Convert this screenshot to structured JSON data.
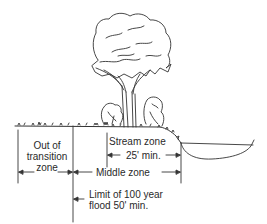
{
  "diagram": {
    "type": "riparian buffer zones cross-section",
    "labels": {
      "out_of_transition_1": "Out of",
      "out_of_transition_2": "transition",
      "out_of_transition_3": "zone",
      "stream_zone": "Stream zone",
      "stream_zone_min": "25' min.",
      "middle_zone": "Middle zone",
      "flood_limit_1": "Limit of 100 year",
      "flood_limit_2": "flood 50' min."
    },
    "elements": [
      "tree",
      "shrub-left",
      "shrub-right",
      "ground-line",
      "stream-channel",
      "dimension-arrows"
    ],
    "colors": {
      "line": "#333333",
      "background": "#ffffff"
    }
  }
}
